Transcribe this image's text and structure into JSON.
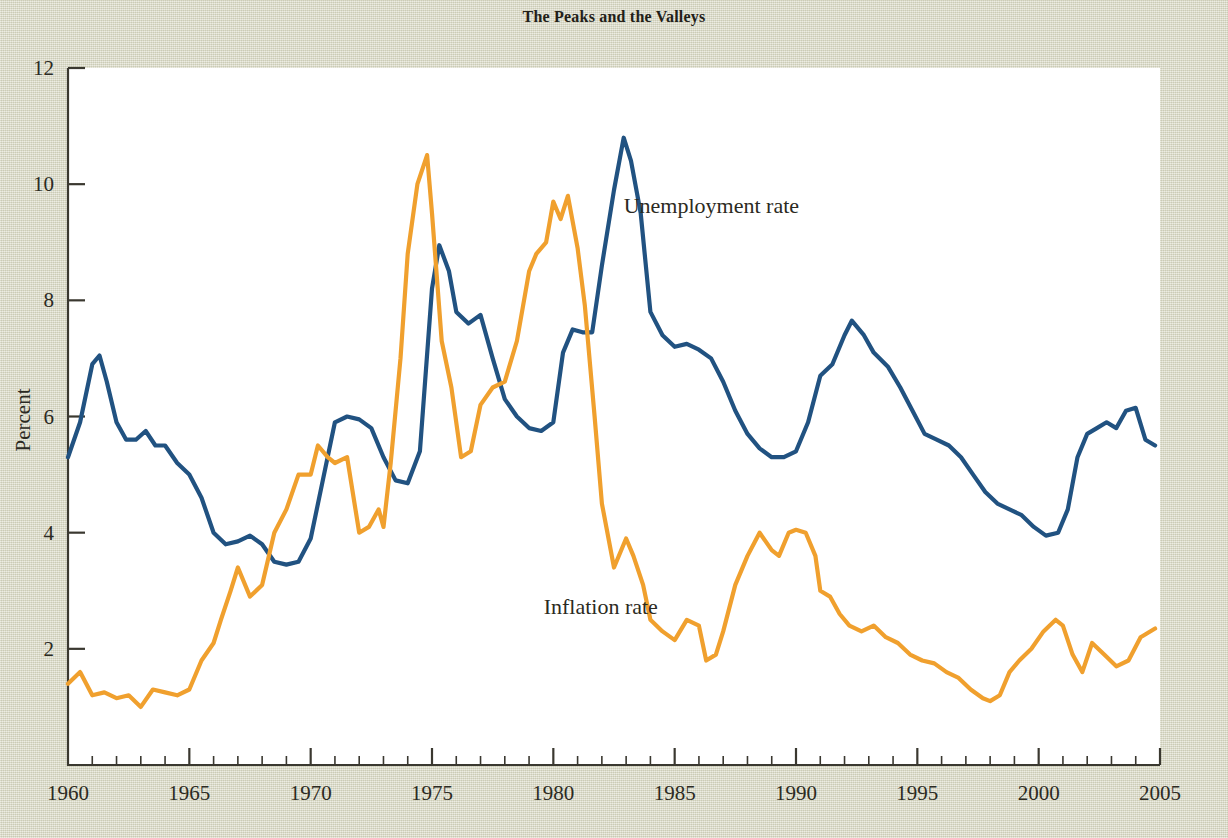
{
  "chart_data": {
    "type": "line",
    "title": "The Peaks and the Valleys",
    "xlabel": "",
    "ylabel": "Percent",
    "xlim": [
      1960,
      2005
    ],
    "ylim": [
      0,
      12
    ],
    "ytick_labels": [
      "2",
      "4",
      "6",
      "8",
      "10",
      "12"
    ],
    "ytick_values": [
      2,
      4,
      6,
      8,
      10,
      12
    ],
    "xtick_labels": [
      "1960",
      "1965",
      "1970",
      "1975",
      "1980",
      "1985",
      "1990",
      "1995",
      "2000",
      "2005"
    ],
    "xtick_values": [
      1960,
      1965,
      1970,
      1975,
      1980,
      1985,
      1990,
      1995,
      2000,
      2005
    ],
    "minor_xtick_interval": 1,
    "grid": false,
    "legend_position": "inline-annotations",
    "annotations": [
      {
        "text": "Unemployment rate",
        "x": 1982.9,
        "y": 9.5
      },
      {
        "text": "Inflation rate",
        "x": 1979.6,
        "y": 2.6
      }
    ],
    "series": [
      {
        "name": "Unemployment rate",
        "color": "#215281",
        "x": [
          1960.0,
          1960.5,
          1961.0,
          1961.3,
          1961.6,
          1962.0,
          1962.4,
          1962.8,
          1963.2,
          1963.6,
          1964.0,
          1964.5,
          1965.0,
          1965.5,
          1966.0,
          1966.5,
          1967.0,
          1967.5,
          1968.0,
          1968.5,
          1969.0,
          1969.5,
          1970.0,
          1970.5,
          1971.0,
          1971.5,
          1972.0,
          1972.5,
          1973.0,
          1973.5,
          1974.0,
          1974.5,
          1975.0,
          1975.3,
          1975.7,
          1976.0,
          1976.5,
          1977.0,
          1977.5,
          1978.0,
          1978.5,
          1979.0,
          1979.5,
          1980.0,
          1980.4,
          1980.8,
          1981.2,
          1981.6,
          1982.0,
          1982.5,
          1982.9,
          1983.2,
          1983.6,
          1984.0,
          1984.5,
          1985.0,
          1985.5,
          1986.0,
          1986.5,
          1987.0,
          1987.5,
          1988.0,
          1988.5,
          1989.0,
          1989.5,
          1990.0,
          1990.5,
          1991.0,
          1991.5,
          1992.0,
          1992.3,
          1992.8,
          1993.2,
          1993.8,
          1994.3,
          1994.8,
          1995.3,
          1995.8,
          1996.3,
          1996.8,
          1997.3,
          1997.8,
          1998.3,
          1998.8,
          1999.3,
          1999.8,
          2000.3,
          2000.8,
          2001.2,
          2001.6,
          2002.0,
          2002.4,
          2002.8,
          2003.2,
          2003.6,
          2004.0,
          2004.4,
          2004.8
        ],
        "y": [
          5.3,
          5.9,
          6.9,
          7.05,
          6.6,
          5.9,
          5.6,
          5.6,
          5.75,
          5.5,
          5.5,
          5.2,
          5.0,
          4.6,
          4.0,
          3.8,
          3.85,
          3.95,
          3.8,
          3.5,
          3.45,
          3.5,
          3.9,
          4.9,
          5.9,
          6.0,
          5.95,
          5.8,
          5.3,
          4.9,
          4.85,
          5.4,
          8.2,
          8.95,
          8.5,
          7.8,
          7.6,
          7.75,
          7.0,
          6.3,
          6.0,
          5.8,
          5.75,
          5.9,
          7.1,
          7.5,
          7.45,
          7.45,
          8.6,
          9.9,
          10.8,
          10.4,
          9.5,
          7.8,
          7.4,
          7.2,
          7.25,
          7.15,
          7.0,
          6.6,
          6.1,
          5.7,
          5.45,
          5.3,
          5.3,
          5.4,
          5.9,
          6.7,
          6.9,
          7.4,
          7.65,
          7.4,
          7.1,
          6.85,
          6.5,
          6.1,
          5.7,
          5.6,
          5.5,
          5.3,
          5.0,
          4.7,
          4.5,
          4.4,
          4.3,
          4.1,
          3.95,
          4.0,
          4.4,
          5.3,
          5.7,
          5.8,
          5.9,
          5.8,
          6.1,
          6.15,
          5.6,
          5.5
        ]
      },
      {
        "name": "Inflation rate",
        "color": "#f0a02e",
        "x": [
          1960.0,
          1960.5,
          1961.0,
          1961.5,
          1962.0,
          1962.5,
          1963.0,
          1963.5,
          1964.0,
          1964.5,
          1965.0,
          1965.5,
          1966.0,
          1966.3,
          1966.7,
          1967.0,
          1967.5,
          1968.0,
          1968.5,
          1969.0,
          1969.5,
          1970.0,
          1970.3,
          1970.7,
          1971.0,
          1971.5,
          1972.0,
          1972.4,
          1972.8,
          1973.0,
          1973.3,
          1973.7,
          1974.0,
          1974.4,
          1974.8,
          1975.0,
          1975.4,
          1975.8,
          1976.2,
          1976.6,
          1977.0,
          1977.5,
          1978.0,
          1978.5,
          1979.0,
          1979.3,
          1979.7,
          1980.0,
          1980.3,
          1980.6,
          1981.0,
          1981.3,
          1981.7,
          1982.0,
          1982.5,
          1983.0,
          1983.3,
          1983.7,
          1984.0,
          1984.5,
          1985.0,
          1985.5,
          1986.0,
          1986.3,
          1986.7,
          1987.0,
          1987.5,
          1988.0,
          1988.5,
          1989.0,
          1989.3,
          1989.7,
          1990.0,
          1990.4,
          1990.8,
          1991.0,
          1991.4,
          1991.8,
          1992.2,
          1992.7,
          1993.2,
          1993.7,
          1994.2,
          1994.7,
          1995.2,
          1995.7,
          1996.2,
          1996.7,
          1997.2,
          1997.7,
          1998.0,
          1998.4,
          1998.8,
          1999.2,
          1999.7,
          2000.2,
          2000.7,
          2001.0,
          2001.4,
          2001.8,
          2002.2,
          2002.7,
          2003.2,
          2003.7,
          2004.2,
          2004.8
        ],
        "y": [
          1.4,
          1.6,
          1.2,
          1.25,
          1.15,
          1.2,
          1.0,
          1.3,
          1.25,
          1.2,
          1.3,
          1.8,
          2.1,
          2.5,
          3.0,
          3.4,
          2.9,
          3.1,
          4.0,
          4.4,
          5.0,
          5.0,
          5.5,
          5.3,
          5.2,
          5.3,
          4.0,
          4.1,
          4.4,
          4.1,
          5.2,
          7.0,
          8.8,
          10.0,
          10.5,
          9.5,
          7.3,
          6.5,
          5.3,
          5.4,
          6.2,
          6.5,
          6.6,
          7.3,
          8.5,
          8.8,
          9.0,
          9.7,
          9.4,
          9.8,
          8.9,
          7.9,
          6.0,
          4.5,
          3.4,
          3.9,
          3.6,
          3.1,
          2.5,
          2.3,
          2.15,
          2.5,
          2.4,
          1.8,
          1.9,
          2.3,
          3.1,
          3.6,
          4.0,
          3.7,
          3.6,
          4.0,
          4.05,
          4.0,
          3.6,
          3.0,
          2.9,
          2.6,
          2.4,
          2.3,
          2.4,
          2.2,
          2.1,
          1.9,
          1.8,
          1.75,
          1.6,
          1.5,
          1.3,
          1.15,
          1.1,
          1.2,
          1.6,
          1.8,
          2.0,
          2.3,
          2.5,
          2.4,
          1.9,
          1.6,
          2.1,
          1.9,
          1.7,
          1.8,
          2.2,
          2.35
        ]
      }
    ]
  }
}
